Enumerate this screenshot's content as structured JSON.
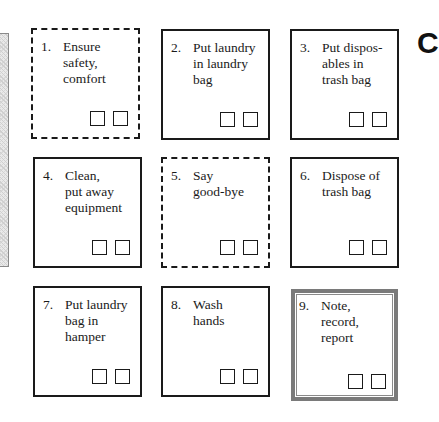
{
  "edge_glyph": "C",
  "steps": [
    {
      "number": "1.",
      "label": "Ensure\nsafety,\ncomfort",
      "border": "dashed",
      "checks": [
        "",
        ""
      ]
    },
    {
      "number": "2.",
      "label": "Put laundry\nin laundry\nbag",
      "border": "solid",
      "checks": [
        "",
        ""
      ]
    },
    {
      "number": "3.",
      "label": "Put dispos-\nables  in\ntrash bag",
      "border": "solid",
      "checks": [
        "",
        ""
      ]
    },
    {
      "number": "4.",
      "label": "Clean,\nput away\nequipment",
      "border": "solid",
      "checks": [
        "",
        ""
      ]
    },
    {
      "number": "5.",
      "label": "Say\ngood-bye",
      "border": "dashed",
      "checks": [
        "",
        ""
      ]
    },
    {
      "number": "6.",
      "label": "Dispose of\ntrash bag",
      "border": "solid",
      "checks": [
        "",
        ""
      ]
    },
    {
      "number": "7.",
      "label": "Put laundry\nbag in\nhamper",
      "border": "solid",
      "checks": [
        "",
        ""
      ]
    },
    {
      "number": "8.",
      "label": "Wash\n hands",
      "border": "solid",
      "checks": [
        "",
        ""
      ]
    },
    {
      "number": "9.",
      "label": "Note, record,\nreport",
      "border": "double",
      "checks": [
        "",
        ""
      ]
    }
  ]
}
